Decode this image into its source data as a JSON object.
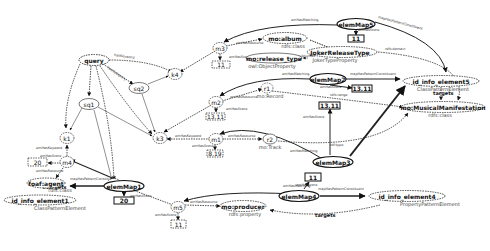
{
  "diagram": {
    "nodes": {
      "query": {
        "label": "query"
      },
      "sq1": {
        "label": "sq1"
      },
      "sq2": {
        "label": "sq2"
      },
      "k1": {
        "label": "k1"
      },
      "k2": {
        "label": "k2"
      },
      "k3": {
        "label": "k3"
      },
      "k4": {
        "label": "k4"
      },
      "m1": {
        "label": "m1"
      },
      "m2": {
        "label": "m2"
      },
      "m3": {
        "label": "m3"
      },
      "m4": {
        "label": "m4"
      },
      "m5": {
        "label": "m5"
      },
      "r1": {
        "label": "r1",
        "type": "mo:Record"
      },
      "r2": {
        "label": "r2",
        "type": "mo:Track"
      },
      "elemMap1": {
        "label": "elemMap1"
      },
      "elemMap2": {
        "label": "elemMap2"
      },
      "elemMap3": {
        "label": "elemMap3"
      },
      "elemMap4": {
        "label": "elemMap4"
      },
      "elemMap5": {
        "label": "elemMap5"
      },
      "mo_album": {
        "label": "mo:album",
        "type": "rdfs:class"
      },
      "mo_release_type": {
        "label": "mo:release_type",
        "type": "owl:ObjectProperty"
      },
      "joker_release_type": {
        "label": "JokerReleaseType",
        "type": "JokerTypeProperty"
      },
      "foaf_agent": {
        "label": "foaf:agent",
        "type": "rdfs:class"
      },
      "mo_producer": {
        "label": "mo:producer",
        "type": "rdfs:property"
      },
      "mo_musical_manifestation": {
        "label": "mo:MusicalManifestation",
        "type": "rdfs:class"
      },
      "info_element_5": {
        "label": "id_info_element5",
        "type": "ClassPatternElement"
      },
      "info_element_1": {
        "label": "id_info_element1",
        "type": "ClassPatternElement"
      },
      "info_element_4": {
        "label": "id_info_element4",
        "type": "PropertyPatternElement"
      }
    },
    "scores": {
      "m1": "8.19",
      "m2": "13.11",
      "m3": "11",
      "m4": "20",
      "m5": "11",
      "elemMap1": "20",
      "elemMap2": "13.11",
      "elemMap3": "13.11",
      "elemMap4": "11",
      "elemMap5": "11"
    },
    "edge_labels": {
      "hasSubquery": "hasSubquery",
      "hasKeyword": "hasKeyword",
      "emHasKeyword": "emHasKeyword",
      "emHasScore": "emHasScore",
      "emHasResource": "emHasResource",
      "emHasMatching": "emHasMatching",
      "mapHasPatternConstituent": "mapHasPatternConstituent",
      "targets": "targets",
      "rdfType": "rdf:type",
      "rdfsDomain": "rdfs:domain",
      "rdfsRange": "rdfs:range",
      "subsumes": "subsumes"
    }
  }
}
